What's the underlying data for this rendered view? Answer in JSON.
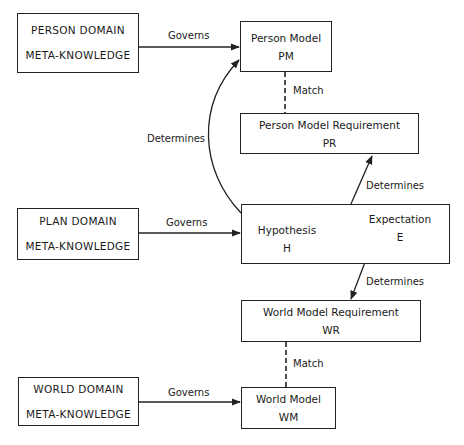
{
  "domains": {
    "person": {
      "line1": "PERSON DOMAIN",
      "line2": "META-KNOWLEDGE"
    },
    "plan": {
      "line1": "PLAN DOMAIN",
      "line2": "META-KNOWLEDGE"
    },
    "world": {
      "line1": "WORLD DOMAIN",
      "line2": "META-KNOWLEDGE"
    }
  },
  "models": {
    "person_model": {
      "name": "Person Model",
      "abbr": "PM"
    },
    "person_requirement": {
      "name": "Person Model Requirement",
      "abbr": "PR"
    },
    "hypothesis": {
      "name": "Hypothesis",
      "abbr": "H"
    },
    "expectation": {
      "name": "Expectation",
      "abbr": "E"
    },
    "world_requirement": {
      "name": "World Model Requirement",
      "abbr": "WR"
    },
    "world_model": {
      "name": "World Model",
      "abbr": "WM"
    }
  },
  "edges": {
    "governs_person": "Governs",
    "governs_plan": "Governs",
    "governs_world": "Governs",
    "match_person": "Match",
    "match_world": "Match",
    "determines_pm": "Determines",
    "determines_pr": "Determines",
    "determines_wr": "Determines"
  }
}
